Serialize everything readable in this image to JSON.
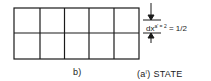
{
  "diagram": {
    "grid": {
      "columns": 5,
      "rows": 2,
      "x": 14,
      "y": 8,
      "width": 125,
      "height": 51,
      "stroke": "#1a1a1a"
    },
    "dimension": {
      "var": "dx",
      "sup": "a'",
      "eq": "= 2",
      "rhs": "= 1/2"
    },
    "panel_label": "b)",
    "state_label_prefix": "(a",
    "state_label_sup": "I",
    "state_label_suffix": ") STATE"
  }
}
